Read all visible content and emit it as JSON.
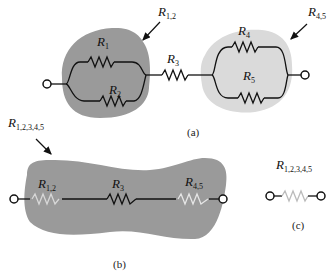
{
  "figure": {
    "part_a": {
      "caption": "(a)",
      "blob_left_label": {
        "main": "R",
        "sub": "1,2"
      },
      "blob_right_label": {
        "main": "R",
        "sub": "4,5"
      },
      "resistors": [
        {
          "main": "R",
          "sub": "1"
        },
        {
          "main": "R",
          "sub": "2"
        },
        {
          "main": "R",
          "sub": "3"
        },
        {
          "main": "R",
          "sub": "4"
        },
        {
          "main": "R",
          "sub": "5"
        }
      ]
    },
    "part_b": {
      "caption": "(b)",
      "blob_label": {
        "main": "R",
        "sub": "1,2,3,4,5"
      },
      "resistors": [
        {
          "main": "R",
          "sub": "1,2"
        },
        {
          "main": "R",
          "sub": "3"
        },
        {
          "main": "R",
          "sub": "4,5"
        }
      ]
    },
    "part_c": {
      "caption": "(c)",
      "label": {
        "main": "R",
        "sub": "1,2,3,4,5"
      }
    },
    "colors": {
      "blob_dark": "#9a9a9a",
      "blob_light": "#d9d9d9",
      "wire": "#111111",
      "equivalent_resistor": "#d8d8d8"
    }
  }
}
